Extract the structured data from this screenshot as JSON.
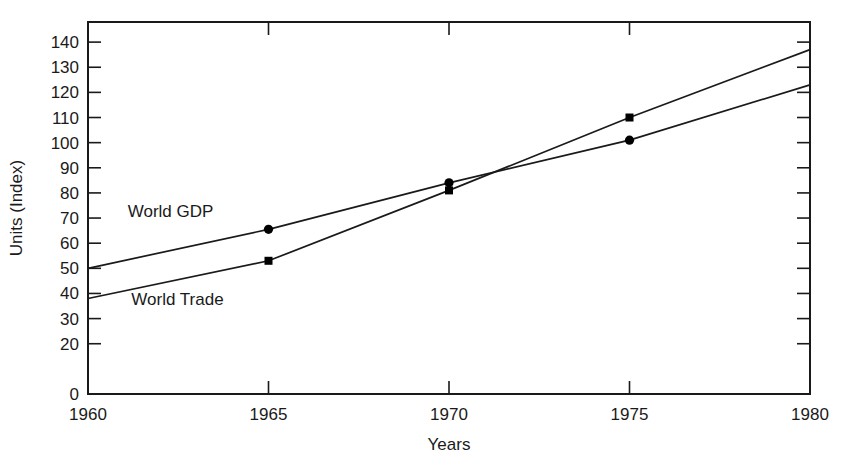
{
  "chart_data": {
    "type": "line",
    "title": "",
    "xlabel": "Years",
    "ylabel": "Units (Index)",
    "x": [
      1960,
      1965,
      1970,
      1975,
      1980
    ],
    "xlim": [
      1960,
      1980
    ],
    "ylim": [
      0,
      148
    ],
    "xticks": [
      "1960",
      "1965",
      "1970",
      "1975",
      "1980"
    ],
    "yticks": [
      "0",
      "20",
      "30",
      "40",
      "50",
      "60",
      "70",
      "80",
      "90",
      "100",
      "110",
      "120",
      "130",
      "140"
    ],
    "ytick_values": [
      0,
      20,
      30,
      40,
      50,
      60,
      70,
      80,
      90,
      100,
      110,
      120,
      130,
      140
    ],
    "grid": false,
    "legend_position": "inline-annotation",
    "series": [
      {
        "name": "World GDP",
        "marker": "circle",
        "values": [
          50,
          65.5,
          84,
          101,
          123
        ]
      },
      {
        "name": "World Trade",
        "marker": "square",
        "values": [
          38,
          53,
          81,
          110,
          137
        ]
      }
    ],
    "annotations": [
      {
        "text": "World GDP",
        "x": 1961.1,
        "y": 70.5
      },
      {
        "text": "World Trade",
        "x": 1961.2,
        "y": 35.5
      }
    ],
    "colors": {
      "line": "#1a1a1a",
      "marker": "#000000",
      "background": "#ffffff"
    }
  }
}
